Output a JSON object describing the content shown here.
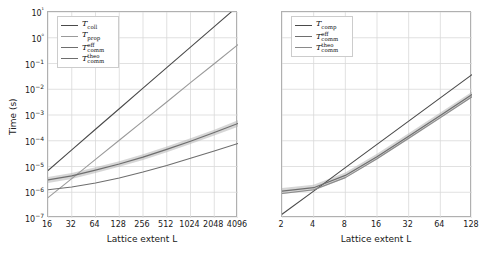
{
  "figure": {
    "ylabel": "Time (s)",
    "background": "#ffffff",
    "grid": true,
    "gridcolor": "#d9d9d9",
    "axiscolor": "#b0b0b0"
  },
  "chart_data": [
    {
      "panel": "left",
      "type": "line",
      "title": "",
      "xlabel": "Lattice extent L",
      "ylabel": "Time (s)",
      "xscale": "log2",
      "yscale": "log10",
      "xlim": [
        16,
        4096
      ],
      "ylim": [
        1e-07,
        10
      ],
      "xticks": [
        16,
        32,
        64,
        128,
        256,
        512,
        1024,
        2048,
        4096
      ],
      "xticklabels": [
        "16",
        "32",
        "64",
        "128",
        "256",
        "512",
        "1024",
        "2048",
        "4096"
      ],
      "yticks": [
        1e-07,
        1e-06,
        1e-05,
        0.0001,
        0.001,
        0.01,
        0.1,
        1,
        10
      ],
      "yticklabels": [
        "10−7",
        "10−6",
        "10−5",
        "10−4",
        "10−3",
        "10−2",
        "10−1",
        "10⁰",
        "10¹"
      ],
      "grid": true,
      "legend_position": "upper left",
      "x": [
        16,
        32,
        64,
        128,
        256,
        512,
        1024,
        2048,
        4096
      ],
      "series": [
        {
          "name": "T_coll",
          "label": "T",
          "sub": "coll",
          "sup": "",
          "color": "#4a4a4a",
          "linewidth": 1.1,
          "band": false,
          "values": [
            7e-06,
            4.4e-05,
            0.00028,
            0.00175,
            0.011,
            0.069,
            0.43,
            2.7,
            17.0
          ]
        },
        {
          "name": "T_prop",
          "label": "T",
          "sub": "prop",
          "sup": "",
          "color": "#9a9a9a",
          "linewidth": 1.1,
          "band": false,
          "values": [
            6.2e-07,
            3.4e-06,
            1.9e-05,
            0.000105,
            0.00058,
            0.0032,
            0.018,
            0.098,
            0.54
          ]
        },
        {
          "name": "T_comm_eff",
          "label": "T",
          "sub": "comm",
          "sup": "eff",
          "color": "#6e6e6e",
          "linewidth": 1.2,
          "band": true,
          "band_color": "#b4b4b4",
          "band_alpha": 0.55,
          "values": [
            3e-06,
            4.3e-06,
            7.2e-06,
            1.25e-05,
            2.3e-05,
            4.6e-05,
            9.6e-05,
            0.00021,
            0.00047
          ],
          "band_lo": [
            2.3e-06,
            3.3e-06,
            5.6e-06,
            9.7e-06,
            1.8e-05,
            3.6e-05,
            7.4e-05,
            0.00016,
            0.00035
          ],
          "band_hi": [
            3.9e-06,
            5.6e-06,
            9.3e-06,
            1.6e-05,
            3e-05,
            6e-05,
            0.000125,
            0.00027,
            0.00063
          ]
        },
        {
          "name": "T_comm_theo",
          "label": "T",
          "sub": "comm",
          "sup": "theo",
          "color": "#6e6e6e",
          "linewidth": 1.1,
          "band": false,
          "values": [
            1.25e-06,
            1.6e-06,
            2.3e-06,
            3.6e-06,
            6.1e-06,
            1.1e-05,
            2.1e-05,
            4e-05,
            7.8e-05
          ]
        }
      ]
    },
    {
      "panel": "right",
      "type": "line",
      "title": "",
      "xlabel": "Lattice extent L",
      "ylabel": "",
      "xscale": "log2",
      "yscale": "log10",
      "xlim": [
        2,
        128
      ],
      "ylim": [
        1e-07,
        10
      ],
      "xticks": [
        2,
        4,
        8,
        16,
        32,
        64,
        128
      ],
      "xticklabels": [
        "2",
        "4",
        "8",
        "16",
        "32",
        "64",
        "128"
      ],
      "yticks": [
        1e-07,
        1e-06,
        1e-05,
        0.0001,
        0.001,
        0.01,
        0.1,
        1,
        10
      ],
      "yticklabels": [],
      "grid": true,
      "legend_position": "upper left",
      "x": [
        2,
        4,
        8,
        16,
        32,
        64,
        128
      ],
      "series": [
        {
          "name": "T_comp",
          "label": "T",
          "sub": "comp",
          "sup": "",
          "color": "#4a4a4a",
          "linewidth": 1.1,
          "band": false,
          "values": [
            1.4e-07,
            1.1e-06,
            9e-06,
            7.2e-05,
            0.00058,
            0.0046,
            0.037
          ]
        },
        {
          "name": "T_comm_eff",
          "label": "T",
          "sub": "comm",
          "sup": "eff",
          "color": "#6e6e6e",
          "linewidth": 1.2,
          "band": true,
          "band_color": "#b4b4b4",
          "band_alpha": 0.55,
          "values": [
            1.1e-06,
            1.5e-06,
            4.5e-06,
            2.4e-05,
            0.00015,
            0.00095,
            0.0062
          ],
          "band_lo": [
            8.5e-07,
            1.15e-06,
            3.5e-06,
            1.85e-05,
            0.000115,
            0.00073,
            0.0048
          ],
          "band_hi": [
            1.45e-06,
            1.95e-06,
            5.8e-06,
            3.1e-05,
            0.000195,
            0.00124,
            0.008
          ]
        },
        {
          "name": "T_comm_theo",
          "label": "T",
          "sub": "comm",
          "sup": "theo",
          "color": "#8a8a8a",
          "linewidth": 1.1,
          "band": false,
          "values": [
            9e-07,
            1.25e-06,
            3.7e-06,
            2e-05,
            0.000125,
            0.00079,
            0.0051
          ]
        }
      ]
    }
  ]
}
